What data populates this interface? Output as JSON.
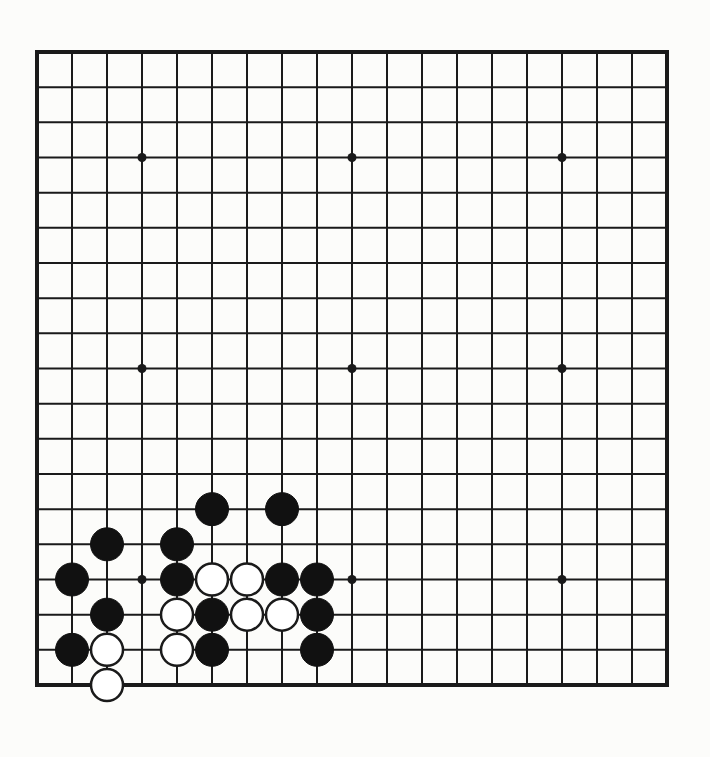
{
  "game": {
    "type": "go",
    "board_size": 19,
    "colors": {
      "paper": "#fcfcfa",
      "line": "#1a1a1a",
      "black_stone": "#111111",
      "white_stone": "#ffffff"
    },
    "star_points": [
      [
        3,
        3
      ],
      [
        9,
        3
      ],
      [
        15,
        3
      ],
      [
        3,
        9
      ],
      [
        9,
        9
      ],
      [
        15,
        9
      ],
      [
        3,
        15
      ],
      [
        9,
        15
      ],
      [
        15,
        15
      ]
    ],
    "stones": {
      "black": [
        [
          5,
          13
        ],
        [
          7,
          13
        ],
        [
          2,
          14
        ],
        [
          4,
          14
        ],
        [
          1,
          15
        ],
        [
          4,
          15
        ],
        [
          7,
          15
        ],
        [
          8,
          15
        ],
        [
          2,
          16
        ],
        [
          5,
          16
        ],
        [
          8,
          16
        ],
        [
          1,
          17
        ],
        [
          5,
          17
        ],
        [
          8,
          17
        ]
      ],
      "white": [
        [
          5,
          15
        ],
        [
          6,
          15
        ],
        [
          4,
          16
        ],
        [
          6,
          16
        ],
        [
          7,
          16
        ],
        [
          2,
          17
        ],
        [
          4,
          17
        ],
        [
          2,
          18
        ]
      ]
    }
  }
}
